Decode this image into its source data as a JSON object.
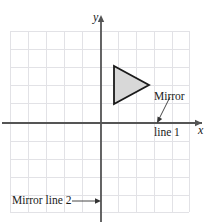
{
  "figure": {
    "background_color": "#ffffff"
  },
  "axes": {
    "x_label": "x",
    "y_label": "y",
    "axis_color": "#555555",
    "origin_px": [
      101,
      123
    ],
    "x_axis_y_px": 123,
    "y_axis_x_px": 101
  },
  "grid": {
    "color": "#e2e2e6",
    "left_px": 10,
    "top_px": 31,
    "right_px": 189,
    "bottom_px": 212,
    "cell_size_px": 18,
    "columns": 10,
    "rows": 10,
    "visible": true
  },
  "shape": {
    "name": "triangle",
    "fill_color": "#d8d8d8",
    "stroke_color": "#1a1a1a",
    "vertices_px": [
      [
        114,
        66
      ],
      [
        114,
        104
      ],
      [
        149,
        85
      ]
    ],
    "vertices_grid": [
      [
        0.7,
        3.2
      ],
      [
        0.7,
        1.1
      ],
      [
        2.7,
        2.1
      ]
    ]
  },
  "annotations": {
    "mirror_line_1": {
      "line1": "Mirror",
      "line2": "line 1",
      "arrow_from_px": [
        170,
        98
      ],
      "arrow_to_px": [
        157,
        121
      ],
      "arrow_color": "#333333"
    },
    "mirror_line_2": {
      "text": "Mirror line 2",
      "arrow_from_px": [
        74,
        201
      ],
      "arrow_to_px": [
        100,
        201
      ],
      "arrow_color": "#333333"
    }
  }
}
